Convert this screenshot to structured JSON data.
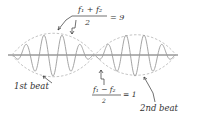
{
  "diagram": {
    "labels": {
      "sum_numerator": "f₁ + f₂",
      "sum_denominator": "2",
      "sum_value": "= 9",
      "diff_numerator": "f₁ − f₂",
      "diff_denominator": "2",
      "diff_value": "= 1",
      "first_beat": "1st beat",
      "second_beat": "2nd beat"
    },
    "colors": {
      "axis": "#555555",
      "wave": "#9a9a9a",
      "envelope": "#bdbdbd",
      "ink": "#333333"
    }
  }
}
